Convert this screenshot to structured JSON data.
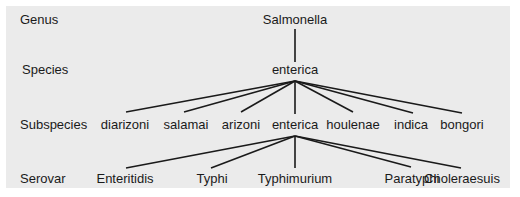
{
  "diagram": {
    "ranks": [
      "Genus",
      "Species",
      "Subspecies",
      "Serovar"
    ],
    "genus": "Salmonella",
    "species": "enterica",
    "subspecies": [
      "diarizoni",
      "salamai",
      "arizoni",
      "enterica",
      "houlenae",
      "indica",
      "bongori"
    ],
    "serovars": [
      "Enteritidis",
      "Typhi",
      "Typhimurium",
      "Paratyphi",
      "Choleraesuis"
    ],
    "edges": [
      {
        "from": "Salmonella",
        "to": "enterica (species)"
      },
      {
        "from": "enterica (species)",
        "to": "diarizoni"
      },
      {
        "from": "enterica (species)",
        "to": "salamai"
      },
      {
        "from": "enterica (species)",
        "to": "arizoni"
      },
      {
        "from": "enterica (species)",
        "to": "enterica (subspecies)"
      },
      {
        "from": "enterica (species)",
        "to": "houlenae"
      },
      {
        "from": "enterica (species)",
        "to": "indica"
      },
      {
        "from": "enterica (species)",
        "to": "bongori"
      },
      {
        "from": "enterica (subspecies)",
        "to": "Enteritidis"
      },
      {
        "from": "enterica (subspecies)",
        "to": "Typhi"
      },
      {
        "from": "enterica (subspecies)",
        "to": "Typhimurium"
      },
      {
        "from": "enterica (subspecies)",
        "to": "Paratyphi"
      },
      {
        "from": "enterica (subspecies)",
        "to": "Choleraesuis"
      }
    ],
    "colors": {
      "background": "#ebebeb",
      "lines": "#1a1a1a",
      "text": "#1a1a1a"
    }
  }
}
